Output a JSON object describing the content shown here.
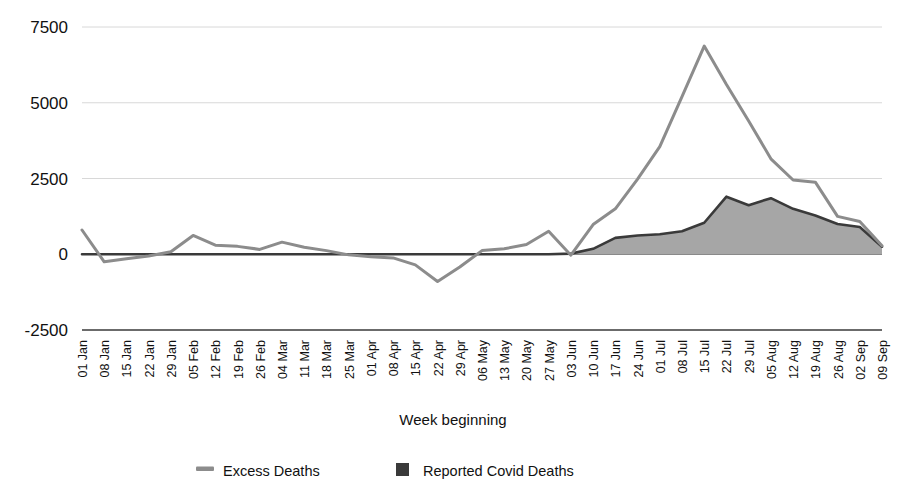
{
  "chart_data": {
    "type": "line",
    "title": "",
    "xlabel": "Week beginning",
    "ylabel": "",
    "ylim": [
      -2500,
      7500
    ],
    "yticks": [
      -2500,
      0,
      2500,
      5000,
      7500
    ],
    "grid": true,
    "legend_position": "bottom",
    "categories": [
      "01 Jan",
      "08 Jan",
      "15 Jan",
      "22 Jan",
      "29 Jan",
      "05 Feb",
      "12 Feb",
      "19 Feb",
      "26 Feb",
      "04 Mar",
      "11 Mar",
      "18 Mar",
      "25 Mar",
      "01 Apr",
      "08 Apr",
      "15 Apr",
      "22 Apr",
      "29 Apr",
      "06 May",
      "13 May",
      "20 May",
      "27 May",
      "03 Jun",
      "10 Jun",
      "17 Jun",
      "24 Jun",
      "01 Jul",
      "08 Jul",
      "15 Jul",
      "22 Jul",
      "29 Jul",
      "05 Aug",
      "12 Aug",
      "19 Aug",
      "26 Aug",
      "02 Sep",
      "09 Sep"
    ],
    "series": [
      {
        "name": "Excess Deaths",
        "type": "line",
        "color": "#8c8c8c",
        "values": [
          800,
          -250,
          -150,
          -60,
          80,
          620,
          300,
          260,
          160,
          400,
          230,
          120,
          -20,
          -80,
          -120,
          -350,
          -900,
          -420,
          120,
          180,
          320,
          760,
          -30,
          980,
          1500,
          2480,
          3550,
          5200,
          6870,
          5600,
          4400,
          3150,
          2450,
          2380,
          1250,
          1080,
          280
        ]
      },
      {
        "name": "Reported Covid Deaths",
        "type": "area",
        "color": "#3a3a3a",
        "fill": "#a6a6a6",
        "values": [
          0,
          0,
          0,
          0,
          0,
          0,
          0,
          0,
          0,
          0,
          0,
          0,
          0,
          0,
          0,
          0,
          0,
          0,
          0,
          0,
          0,
          0,
          20,
          180,
          540,
          620,
          660,
          760,
          1040,
          1900,
          1620,
          1850,
          1500,
          1280,
          1000,
          900,
          250
        ]
      }
    ]
  },
  "axis": {
    "x_title": "Week beginning",
    "y_tick_labels": [
      "7500",
      "5000",
      "2500",
      "0",
      "-2500"
    ]
  },
  "legend": {
    "items": [
      {
        "label": "Excess Deaths",
        "marker": "line-swatch",
        "color": "#8c8c8c"
      },
      {
        "label": "Reported Covid Deaths",
        "marker": "square-swatch",
        "color": "#3a3a3a"
      }
    ]
  }
}
